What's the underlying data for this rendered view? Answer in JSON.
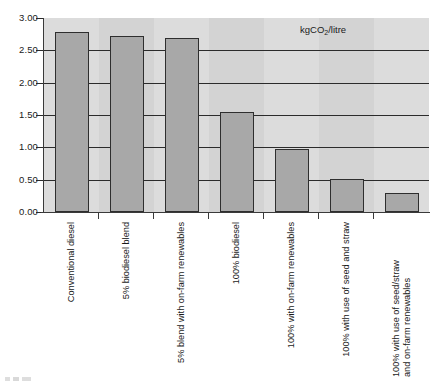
{
  "chart_data": {
    "type": "bar",
    "title": "",
    "subtitle": "",
    "unit_annotation": "kgCO2/litre",
    "unit_annotation_parts": {
      "prefix": "kgCO",
      "subscript": "2",
      "suffix": "/litre"
    },
    "xlabel": "",
    "ylabel": "",
    "ylim": [
      0.0,
      3.0
    ],
    "ytick_step": 0.5,
    "ytick_labels": [
      "0.00",
      "0.50",
      "1.00",
      "1.50",
      "2.00",
      "2.50",
      "3.00"
    ],
    "ytick_values": [
      0.0,
      0.5,
      1.0,
      1.5,
      2.0,
      2.5,
      3.0
    ],
    "grid": true,
    "legend_position": "none",
    "categories": [
      "Conventional diesel",
      "5% biodiesel blend",
      "5% blend with on-farm renewables",
      "100% biodiesel",
      "100% with on-farm renewables",
      "100% with use of seed and straw",
      "100% with use of seed/straw and on-farm renewables"
    ],
    "category_lines": [
      [
        "Conventional diesel"
      ],
      [
        "5% biodiesel blend"
      ],
      [
        "5% blend with on-farm renewables"
      ],
      [
        "100% biodiesel"
      ],
      [
        "100% with on-farm renewables"
      ],
      [
        "100% with use of seed and straw"
      ],
      [
        "100% with use of seed/straw",
        "and on-farm renewables"
      ]
    ],
    "values": [
      2.78,
      2.72,
      2.69,
      1.54,
      0.97,
      0.51,
      0.29
    ],
    "bar_color": "#a8a8a8",
    "bar_border_color": "#2e2e2e",
    "plot_background": "#d3d3d3",
    "grid_color": "#2b2b2b",
    "axis_color": "#3a3a3a",
    "text_color": "#1a1a1a"
  }
}
